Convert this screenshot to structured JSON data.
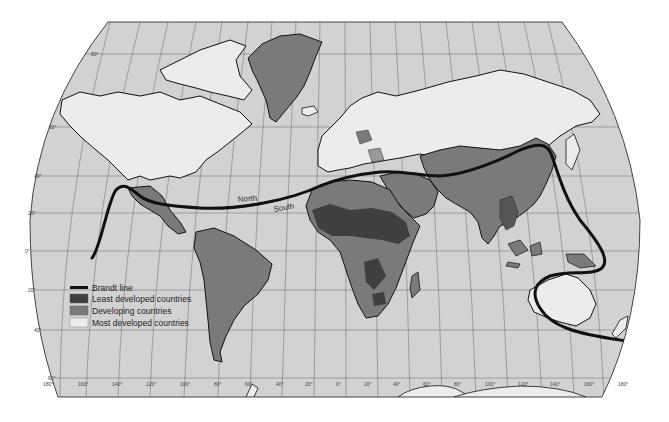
{
  "map": {
    "title": "North-South divide (Brandt line)",
    "colors": {
      "ocean": "#d2d2d2",
      "most_developed": "#ececec",
      "developing": "#7a7a7a",
      "least_developed": "#3f3f3f",
      "brandt_line": "#111111",
      "grid": "#555555",
      "coast": "#111111"
    },
    "divide_labels": {
      "north": "North",
      "south": "South"
    },
    "legend": {
      "items": [
        {
          "symbol": "line",
          "label": "Brandt line"
        },
        {
          "symbol": "swatch-dark",
          "label": "Least developed countries"
        },
        {
          "symbol": "swatch-mid",
          "label": "Developing countries"
        },
        {
          "symbol": "swatch-light",
          "label": "Most developed countries"
        }
      ]
    },
    "latitude_labels": [
      "80°",
      "60°",
      "40°",
      "20°",
      "0°",
      "20°",
      "40°",
      "60°"
    ],
    "longitude_labels": [
      "180°",
      "160°",
      "140°",
      "120°",
      "100°",
      "80°",
      "60°",
      "40°",
      "20°",
      "0°",
      "20°",
      "40°",
      "60°",
      "80°",
      "100°",
      "120°",
      "140°",
      "160°",
      "180°"
    ]
  }
}
